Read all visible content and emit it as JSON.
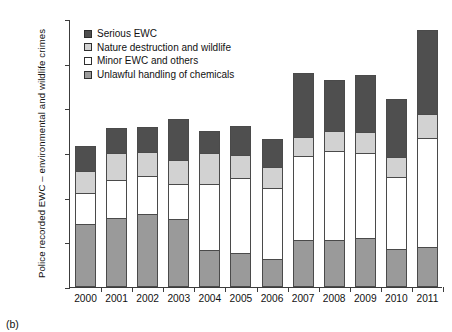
{
  "figure": {
    "caption": "(b)"
  },
  "chart_data": {
    "type": "bar",
    "stacked": true,
    "title": "",
    "xlabel": "",
    "ylabel": "Police recorded EWC – environmental and wildlife crimes",
    "ylim": [
      0,
      6000
    ],
    "ytick_labels": [
      "0",
      "1,000",
      "2,000",
      "3,000",
      "4,000",
      "5,000",
      "6,000"
    ],
    "ytick_values": [
      0,
      1000,
      2000,
      3000,
      4000,
      5000,
      6000
    ],
    "grid": false,
    "legend_position": "top-left",
    "categories": [
      "2000",
      "2001",
      "2002",
      "2003",
      "2004",
      "2005",
      "2006",
      "2007",
      "2008",
      "2009",
      "2010",
      "2011"
    ],
    "series": [
      {
        "name": "Unlawful handling of chemicals",
        "color": "#9a9a9a",
        "values": [
          1400,
          1540,
          1640,
          1520,
          820,
          760,
          620,
          1050,
          1060,
          1090,
          860,
          900
        ]
      },
      {
        "name": "Minor EWC and others",
        "color": "#ffffff",
        "values": [
          700,
          850,
          850,
          790,
          1480,
          1680,
          1590,
          1890,
          1990,
          1910,
          1600,
          2430
        ]
      },
      {
        "name": "Nature destruction and wildlife",
        "color": "#d2d2d2",
        "values": [
          500,
          620,
          540,
          530,
          690,
          520,
          470,
          410,
          440,
          460,
          460,
          550
        ]
      },
      {
        "name": "Serious EWC",
        "color": "#4f4f4f",
        "values": [
          550,
          550,
          560,
          930,
          500,
          640,
          640,
          1450,
          1150,
          1290,
          1290,
          1870
        ]
      }
    ],
    "totals": [
      3150,
      3560,
      3590,
      3770,
      3490,
      3600,
      3320,
      4800,
      4640,
      4750,
      4210,
      5750
    ]
  }
}
